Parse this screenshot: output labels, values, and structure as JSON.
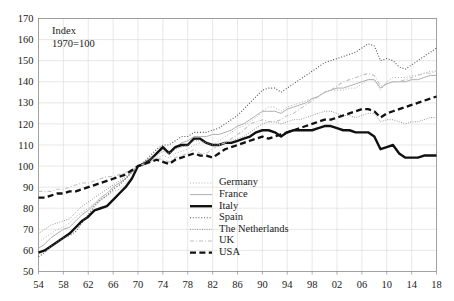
{
  "chart_data": {
    "type": "line",
    "title": "",
    "annotation": "Index\n1970=100",
    "annotation_lines": [
      "Index",
      "1970=100"
    ],
    "xlabel": "",
    "ylabel": "",
    "xlim": [
      1954,
      2018
    ],
    "ylim": [
      50,
      170
    ],
    "grid": true,
    "legend_position": "center-bottom-inside",
    "x_tick_labels": [
      "54",
      "58",
      "62",
      "66",
      "70",
      "74",
      "78",
      "82",
      "86",
      "90",
      "94",
      "98",
      "02",
      "06",
      "10",
      "14",
      "18"
    ],
    "x_tick_values": [
      1954,
      1958,
      1962,
      1966,
      1970,
      1974,
      1978,
      1982,
      1986,
      1990,
      1994,
      1998,
      2002,
      2006,
      2010,
      2014,
      2018
    ],
    "y_tick_labels": [
      "50",
      "60",
      "70",
      "80",
      "90",
      "100",
      "110",
      "120",
      "130",
      "140",
      "150",
      "160",
      "170"
    ],
    "y_tick_values": [
      50,
      60,
      70,
      80,
      90,
      100,
      110,
      120,
      130,
      140,
      150,
      160,
      170
    ],
    "x": [
      1954,
      1955,
      1956,
      1957,
      1958,
      1959,
      1960,
      1961,
      1962,
      1963,
      1964,
      1965,
      1966,
      1967,
      1968,
      1969,
      1970,
      1971,
      1972,
      1973,
      1974,
      1975,
      1976,
      1977,
      1978,
      1979,
      1980,
      1981,
      1982,
      1983,
      1984,
      1985,
      1986,
      1987,
      1988,
      1989,
      1990,
      1991,
      1992,
      1993,
      1994,
      1995,
      1996,
      1997,
      1998,
      1999,
      2000,
      2001,
      2002,
      2003,
      2004,
      2005,
      2006,
      2007,
      2008,
      2009,
      2010,
      2011,
      2012,
      2013,
      2014,
      2015,
      2016,
      2017,
      2018
    ],
    "series": [
      {
        "name": "Germany",
        "style": "dotted-light",
        "color": "#b5b5b5",
        "values": [
          64,
          66,
          68,
          70,
          71,
          73,
          76,
          78,
          80,
          82,
          84,
          86,
          88,
          89,
          92,
          95,
          100,
          101,
          102,
          104,
          105,
          104,
          106,
          107,
          108,
          110,
          111,
          111,
          110,
          112,
          114,
          116,
          118,
          119,
          121,
          123,
          126,
          128,
          128,
          126,
          128,
          129,
          130,
          131,
          132,
          133,
          135,
          136,
          136,
          136,
          137,
          137,
          139,
          141,
          141,
          136,
          140,
          142,
          142,
          142,
          143,
          143,
          144,
          145,
          145
        ]
      },
      {
        "name": "France",
        "style": "solid-light",
        "color": "#b0b0b0",
        "values": [
          61,
          63,
          66,
          68,
          70,
          71,
          74,
          77,
          79,
          82,
          85,
          87,
          90,
          92,
          94,
          97,
          100,
          102,
          104,
          106,
          108,
          107,
          109,
          111,
          112,
          114,
          114,
          114,
          115,
          115,
          116,
          117,
          119,
          120,
          122,
          124,
          126,
          126,
          126,
          125,
          127,
          128,
          129,
          130,
          132,
          133,
          135,
          136,
          137,
          137,
          138,
          139,
          140,
          141,
          141,
          137,
          139,
          140,
          140,
          140,
          141,
          141,
          142,
          143,
          143
        ]
      },
      {
        "name": "Italy",
        "style": "solid-bold",
        "color": "#111111",
        "values": [
          59,
          60,
          62,
          64,
          66,
          68,
          71,
          74,
          76,
          79,
          80,
          81,
          84,
          87,
          90,
          94,
          100,
          101,
          103,
          106,
          109,
          106,
          109,
          110,
          110,
          113,
          113,
          111,
          110,
          110,
          111,
          111,
          112,
          113,
          114,
          116,
          117,
          117,
          116,
          114,
          116,
          117,
          117,
          117,
          117,
          118,
          119,
          119,
          118,
          117,
          117,
          116,
          116,
          116,
          114,
          108,
          109,
          110,
          106,
          104,
          104,
          104,
          105,
          105,
          105
        ]
      },
      {
        "name": "Spain",
        "style": "dotted-dark",
        "color": "#555555",
        "values": [
          57,
          59,
          62,
          64,
          66,
          67,
          69,
          73,
          77,
          81,
          84,
          86,
          89,
          91,
          94,
          97,
          100,
          102,
          105,
          108,
          110,
          110,
          112,
          114,
          114,
          116,
          116,
          116,
          117,
          118,
          120,
          122,
          124,
          127,
          130,
          133,
          136,
          137,
          137,
          135,
          137,
          139,
          141,
          143,
          145,
          147,
          149,
          150,
          151,
          152,
          153,
          154,
          156,
          158,
          157,
          150,
          151,
          150,
          147,
          146,
          148,
          150,
          152,
          154,
          156
        ]
      },
      {
        "name": "The Netherlands",
        "style": "dotted-fine",
        "color": "#8f8f8f",
        "values": [
          68,
          70,
          72,
          73,
          74,
          75,
          78,
          81,
          83,
          85,
          87,
          89,
          91,
          93,
          95,
          97,
          100,
          101,
          103,
          105,
          107,
          106,
          108,
          109,
          110,
          112,
          112,
          111,
          110,
          110,
          111,
          112,
          113,
          114,
          116,
          118,
          120,
          121,
          121,
          120,
          121,
          122,
          122,
          123,
          124,
          125,
          126,
          126,
          125,
          124,
          124,
          123,
          124,
          125,
          125,
          121,
          122,
          122,
          121,
          120,
          121,
          121,
          122,
          123,
          123
        ]
      },
      {
        "name": "UK",
        "style": "dashdot-light",
        "color": "#c2c2c2",
        "values": [
          88,
          88,
          88,
          89,
          89,
          90,
          91,
          92,
          92,
          93,
          94,
          95,
          95,
          96,
          97,
          98,
          100,
          101,
          102,
          104,
          103,
          102,
          104,
          105,
          106,
          108,
          106,
          106,
          108,
          110,
          111,
          113,
          115,
          117,
          120,
          121,
          122,
          121,
          121,
          122,
          124,
          125,
          127,
          129,
          131,
          133,
          135,
          136,
          138,
          140,
          141,
          142,
          143,
          144,
          143,
          138,
          139,
          140,
          140,
          141,
          142,
          143,
          144,
          144,
          145
        ]
      },
      {
        "name": "USA",
        "style": "dashed-bold",
        "color": "#111111",
        "values": [
          85,
          85,
          86,
          87,
          87,
          88,
          88,
          89,
          90,
          91,
          92,
          93,
          94,
          95,
          96,
          98,
          100,
          101,
          102,
          103,
          102,
          101,
          103,
          104,
          105,
          106,
          105,
          105,
          104,
          106,
          108,
          109,
          110,
          111,
          112,
          113,
          114,
          113,
          114,
          115,
          116,
          117,
          118,
          119,
          120,
          121,
          122,
          122,
          123,
          124,
          125,
          126,
          127,
          127,
          126,
          123,
          125,
          126,
          127,
          128,
          129,
          130,
          131,
          132,
          133
        ]
      }
    ]
  },
  "legend": {
    "items": [
      {
        "label": "Germany"
      },
      {
        "label": "France"
      },
      {
        "label": "Italy"
      },
      {
        "label": "Spain"
      },
      {
        "label": "The Netherlands"
      },
      {
        "label": "UK"
      },
      {
        "label": "USA"
      }
    ]
  }
}
